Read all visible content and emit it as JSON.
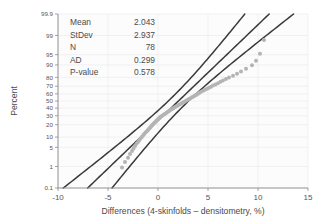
{
  "chart_data": {
    "type": "scatter",
    "subtype": "normal-probability-plot",
    "title": "",
    "xlabel": "Differences (4-skinfolds – densitometry, %)",
    "ylabel": "Percent",
    "xlim": [
      -10,
      15
    ],
    "xticks": [
      "-10",
      "-5",
      "0",
      "5",
      "10",
      "15"
    ],
    "xtick_values": [
      -10,
      -5,
      0,
      5,
      10,
      15
    ],
    "yticks": [
      "99.9",
      "99",
      "95",
      "90",
      "80",
      "70",
      "60",
      "50",
      "40",
      "30",
      "20",
      "10",
      "5",
      "1",
      "0.1"
    ],
    "ytick_values": [
      99.9,
      99,
      95,
      90,
      80,
      70,
      60,
      50,
      40,
      30,
      20,
      10,
      5,
      1,
      0.1
    ],
    "grid": true,
    "legend_position": "none",
    "series": [
      {
        "name": "Differences (4-skinfolds – densitometry, %)",
        "marker": "circle",
        "color": "#b4b4b4",
        "x": [
          -3.6,
          -3.3,
          -3.0,
          -2.8,
          -2.6,
          -2.45,
          -2.3,
          -2.15,
          -2.0,
          -1.88,
          -1.75,
          -1.62,
          -1.5,
          -1.38,
          -1.25,
          -1.12,
          -1.0,
          -0.9,
          -0.8,
          -0.7,
          -0.6,
          -0.5,
          -0.4,
          -0.3,
          -0.2,
          -0.1,
          0.0,
          0.1,
          0.2,
          0.3,
          0.45,
          0.6,
          0.72,
          0.85,
          0.97,
          1.1,
          1.22,
          1.35,
          1.5,
          1.62,
          1.75,
          1.9,
          2.05,
          2.2,
          2.35,
          2.5,
          2.65,
          2.8,
          2.95,
          3.1,
          3.25,
          3.4,
          3.55,
          3.7,
          3.85,
          4.0,
          4.15,
          4.3,
          4.5,
          4.7,
          4.9,
          5.1,
          5.3,
          5.5,
          5.75,
          6.0,
          6.25,
          6.5,
          6.8,
          7.1,
          7.5,
          7.9,
          8.3,
          8.8,
          9.4,
          9.8,
          10.2,
          10.6
        ],
        "percent": [
          0.9,
          1.5,
          2.2,
          3.0,
          3.8,
          4.6,
          5.5,
          6.4,
          7.3,
          8.2,
          9.2,
          10.1,
          11.1,
          12.1,
          13.1,
          14.1,
          15.2,
          16.2,
          17.2,
          18.3,
          19.4,
          20.4,
          21.5,
          22.6,
          23.7,
          24.8,
          25.9,
          27.0,
          28.1,
          29.2,
          30.4,
          31.5,
          32.6,
          33.8,
          34.9,
          36.1,
          37.2,
          38.4,
          39.6,
          40.7,
          41.9,
          43.1,
          44.3,
          45.5,
          46.7,
          47.9,
          49.1,
          50.3,
          51.5,
          52.7,
          54.0,
          55.2,
          56.4,
          57.7,
          58.9,
          60.2,
          61.5,
          62.8,
          64.1,
          65.4,
          66.7,
          68.1,
          69.4,
          70.8,
          72.2,
          73.7,
          75.2,
          76.7,
          78.3,
          79.9,
          81.6,
          83.4,
          85.3,
          87.4,
          89.8,
          92.4,
          95.3,
          98.5
        ]
      }
    ],
    "fit_line": {
      "name": "normal-fit-line",
      "color": "#3a3a3a",
      "mean": 2.043,
      "stdev": 2.937
    },
    "confidence_bands": {
      "name": "confidence-interval-bands",
      "color": "#3a3a3a",
      "level": 95
    }
  },
  "stats_box": {
    "name": "anderson-darling-stats",
    "rows": [
      {
        "label": "Mean",
        "value": "2.043"
      },
      {
        "label": "StDev",
        "value": "2.937"
      },
      {
        "label": "N",
        "value": "78"
      },
      {
        "label": "AD",
        "value": "0.299"
      },
      {
        "label": "P-value",
        "value": "0.578"
      }
    ]
  },
  "colors": {
    "background": "#ffffff",
    "plot_background": "#fcfcfd",
    "grid": "#e9e9ec",
    "axis": "#8a8a8a",
    "line": "#3a3a3a",
    "marker": "#b4b4b4",
    "text": "#4a4a4a"
  }
}
